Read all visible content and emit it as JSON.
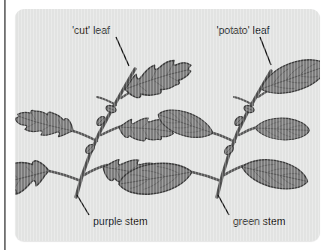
{
  "figure": {
    "type": "botanical-comparison-diagram",
    "panel_background": "#e2e3e2",
    "labels": {
      "cut_leaf": "'cut' leaf",
      "potato_leaf": "'potato' leaf",
      "purple_stem": "purple stem",
      "green_stem": "green stem"
    },
    "specimens": [
      {
        "name": "left-specimen",
        "leaf_type_label": "'cut' leaf",
        "stem_label": "purple stem",
        "leaf_shape": "lobed-serrated",
        "leaf_count": 5,
        "bud_count": 3
      },
      {
        "name": "right-specimen",
        "leaf_type_label": "'potato' leaf",
        "stem_label": "green stem",
        "leaf_shape": "smooth-oval",
        "leaf_count": 5,
        "bud_count": 3
      }
    ],
    "colors": {
      "leaf_fill": "#7c7c7c",
      "leaf_outline": "#3d3d3d",
      "vein": "#5d5d5d",
      "stem": "#575757",
      "leader_line": "#141414",
      "text": "#1a1a1a",
      "panel": "#e2e3e2",
      "page": "#ffffff",
      "left_rule": "#6f6f6f"
    }
  }
}
